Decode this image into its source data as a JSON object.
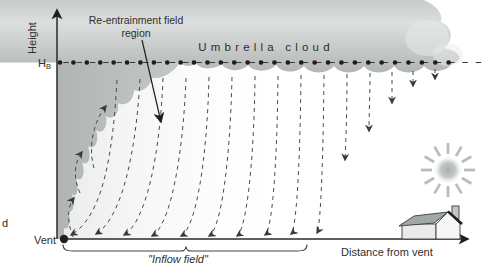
{
  "figure": {
    "type": "volcanic-plume-umbrella-cloud-diagram",
    "labels": {
      "y_axis": "Height",
      "hb_main": "H",
      "hb_sub": "B",
      "vent": "Vent",
      "x_axis": "Distance from vent",
      "umbrella_cloud": "Umbrella cloud",
      "reentrainment_line1": "Re-entrainment field",
      "reentrainment_line2": "region",
      "inflow_field": "\"Inflow field\"",
      "stray_left_edge_text": "d"
    },
    "icons": {
      "sun": "sun-icon",
      "house": "house-icon"
    },
    "colors": {
      "background": "#ffffff",
      "cloud_top": "#c7cbc9",
      "cloud_light_band": "#dcdfdd",
      "cloud_base": "#b2b7b5",
      "plume_column": "#b6bab8",
      "inflow_wash": "#d7dbd9",
      "axis_and_text": "#2e2e2e",
      "streamline_dash": "#4a4a4a",
      "sun_gray": "#b9bebc",
      "house_roof": "#a2a8a6"
    }
  }
}
